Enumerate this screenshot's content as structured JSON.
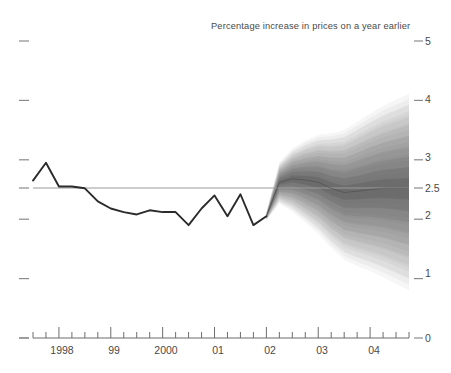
{
  "chart_data": {
    "type": "area",
    "title": "Percentage increase in prices on a year earlier",
    "subtitle": "",
    "xlabel": "",
    "ylabel": "",
    "ylim": [
      0,
      5
    ],
    "yticks": [
      0,
      1,
      2,
      2.5,
      3,
      4,
      5
    ],
    "ytick_labels": [
      "0",
      "1",
      "2",
      "2.5",
      "3",
      "4",
      "5"
    ],
    "grid": false,
    "legend_position": "none",
    "target_line": 2.5,
    "x": [
      "1997 Q3",
      "1997 Q4",
      "1998 Q1",
      "1998 Q2",
      "1998 Q3",
      "1998 Q4",
      "1999 Q1",
      "1999 Q2",
      "1999 Q3",
      "1999 Q4",
      "2000 Q1",
      "2000 Q2",
      "2000 Q3",
      "2000 Q4",
      "2001 Q1",
      "2001 Q2",
      "2001 Q3",
      "2001 Q4",
      "2002 Q1",
      "2002 Q2",
      "2002 Q3",
      "2002 Q4",
      "2003 Q1",
      "2003 Q2",
      "2003 Q3",
      "2003 Q4",
      "2004 Q1",
      "2004 Q2",
      "2004 Q3",
      "2004 Q4"
    ],
    "xtick_labels": [
      "1998",
      "99",
      "2000",
      "01",
      "02",
      "03",
      "04"
    ],
    "xtick_positions": [
      1998,
      1999,
      2000,
      2001,
      2002,
      2003,
      2004
    ],
    "x_range": [
      1997.5,
      2004.75
    ],
    "forecast_start": "2002 Q1",
    "series": [
      {
        "name": "Historical inflation (RPIX)",
        "type": "line",
        "color": "#2b2b2b",
        "x": [
          1997.5,
          1997.75,
          1998.0,
          1998.25,
          1998.5,
          1998.75,
          1999.0,
          1999.25,
          1999.5,
          1999.75,
          2000.0,
          2000.25,
          2000.5,
          2000.75,
          2001.0,
          2001.25,
          2001.5,
          2001.75,
          2002.0
        ],
        "values": [
          2.65,
          2.95,
          2.55,
          2.55,
          2.52,
          2.3,
          2.18,
          2.12,
          2.08,
          2.15,
          2.12,
          2.12,
          1.9,
          2.18,
          2.4,
          2.05,
          2.42,
          1.9,
          2.05
        ]
      },
      {
        "name": "Projection central (mode)",
        "type": "line",
        "color": "#3c3c3c",
        "x": [
          2002.0,
          2002.25,
          2002.5,
          2002.75,
          2003.0,
          2003.25,
          2003.5,
          2003.75,
          2004.0,
          2004.25,
          2004.5,
          2004.75
        ],
        "values": [
          2.05,
          2.62,
          2.68,
          2.66,
          2.62,
          2.52,
          2.45,
          2.47,
          2.5,
          2.52,
          2.52,
          2.52
        ]
      }
    ],
    "fan_bands": [
      {
        "probability": 10,
        "shade": "#8d8d8d"
      },
      {
        "probability": 20,
        "shade": "#a0a0a0"
      },
      {
        "probability": 30,
        "shade": "#b2b2b2"
      },
      {
        "probability": 40,
        "shade": "#c2c2c2"
      },
      {
        "probability": 50,
        "shade": "#d0d0d0"
      },
      {
        "probability": 60,
        "shade": "#dcdcdc"
      },
      {
        "probability": 70,
        "shade": "#e6e6e6"
      },
      {
        "probability": 80,
        "shade": "#efefef"
      },
      {
        "probability": 90,
        "shade": "#f6f6f6"
      }
    ],
    "annotations": []
  },
  "axis": {
    "y_labels": [
      "5",
      "4",
      "3",
      "2.5",
      "2",
      "1",
      "0"
    ],
    "x_labels": [
      "1998",
      "99",
      "2000",
      "01",
      "02",
      "03",
      "04"
    ]
  },
  "caption": {
    "text": ""
  }
}
